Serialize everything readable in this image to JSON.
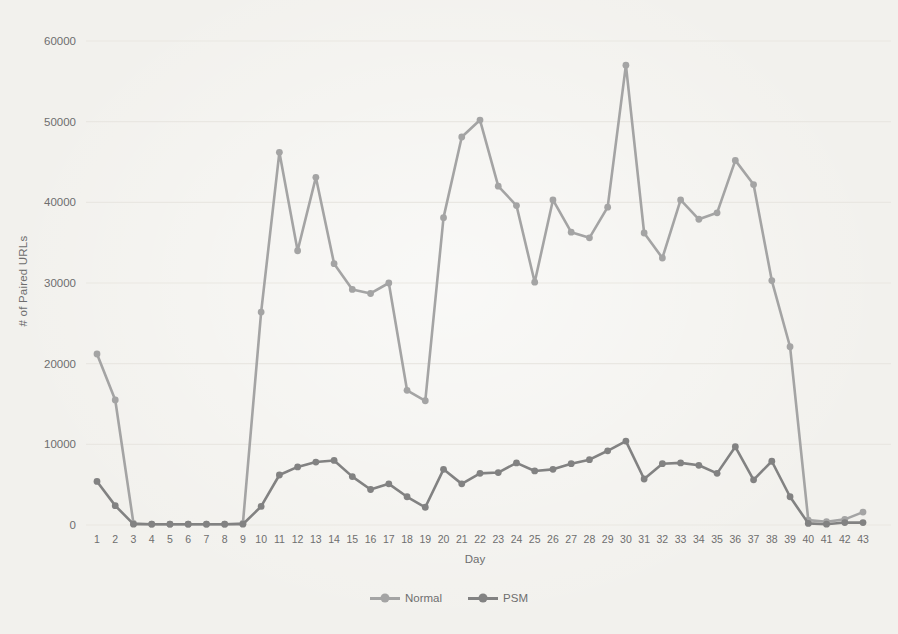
{
  "colors": {
    "paper": "#f2f1ed",
    "grid": "#e9e7e2",
    "axis_text": "#6e6e6e",
    "normal_series": "#a4a4a4",
    "psm_series": "#828282"
  },
  "chart_data": {
    "type": "line",
    "title": "",
    "xlabel": "Day",
    "ylabel": "# of Paired URLs",
    "legend_position": "bottom",
    "grid": true,
    "ylim": [
      0,
      60000
    ],
    "yticks": [
      0,
      10000,
      20000,
      30000,
      40000,
      50000,
      60000
    ],
    "x": [
      1,
      2,
      3,
      4,
      5,
      6,
      7,
      8,
      9,
      10,
      11,
      12,
      13,
      14,
      15,
      16,
      17,
      18,
      19,
      20,
      21,
      22,
      23,
      24,
      25,
      26,
      27,
      28,
      29,
      30,
      31,
      32,
      33,
      34,
      35,
      36,
      37,
      38,
      39,
      40,
      41,
      42,
      43
    ],
    "series": [
      {
        "name": "Normal",
        "color": "#a4a4a4",
        "values": [
          21200,
          15500,
          200,
          100,
          100,
          100,
          100,
          100,
          200,
          26400,
          46200,
          34000,
          43100,
          32400,
          29200,
          28700,
          30000,
          16700,
          15400,
          38100,
          48100,
          50200,
          42000,
          39600,
          30100,
          40300,
          36300,
          35600,
          39400,
          57000,
          36200,
          33100,
          40300,
          37900,
          38700,
          45200,
          42200,
          30300,
          22100,
          600,
          400,
          700,
          1600
        ]
      },
      {
        "name": "PSM",
        "color": "#828282",
        "values": [
          5400,
          2400,
          100,
          100,
          100,
          100,
          100,
          100,
          100,
          2300,
          6200,
          7200,
          7800,
          8000,
          6000,
          4400,
          5100,
          3500,
          2200,
          6900,
          5100,
          6400,
          6500,
          7700,
          6700,
          6900,
          7600,
          8100,
          9200,
          10400,
          5700,
          7600,
          7700,
          7400,
          6400,
          9700,
          5600,
          7900,
          3500,
          200,
          100,
          300,
          300
        ]
      }
    ]
  }
}
